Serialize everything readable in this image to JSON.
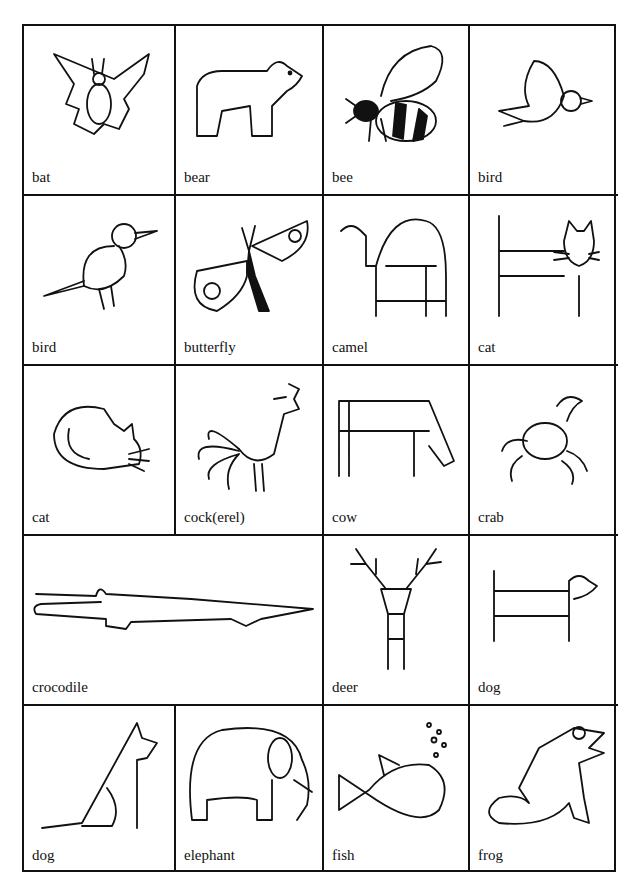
{
  "cards": [
    {
      "label": "bat",
      "icon": "bat-icon"
    },
    {
      "label": "bear",
      "icon": "bear-icon"
    },
    {
      "label": "bee",
      "icon": "bee-icon"
    },
    {
      "label": "bird",
      "icon": "flying-bird-icon"
    },
    {
      "label": "bird",
      "icon": "perched-bird-icon"
    },
    {
      "label": "butterfly",
      "icon": "butterfly-icon"
    },
    {
      "label": "camel",
      "icon": "camel-icon"
    },
    {
      "label": "cat",
      "icon": "cat-peeking-icon"
    },
    {
      "label": "cat",
      "icon": "sleeping-cat-icon"
    },
    {
      "label": "cock(erel)",
      "icon": "rooster-icon"
    },
    {
      "label": "cow",
      "icon": "cow-icon"
    },
    {
      "label": "crab",
      "icon": "crab-icon"
    },
    {
      "label": "crocodile",
      "icon": "crocodile-icon"
    },
    {
      "label": "deer",
      "icon": "deer-icon"
    },
    {
      "label": "dog",
      "icon": "dachshund-icon"
    },
    {
      "label": "dog",
      "icon": "sitting-dog-icon"
    },
    {
      "label": "elephant",
      "icon": "elephant-icon"
    },
    {
      "label": "fish",
      "icon": "fish-icon"
    },
    {
      "label": "frog",
      "icon": "frog-icon"
    }
  ]
}
